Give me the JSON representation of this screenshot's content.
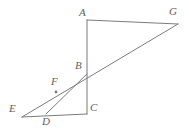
{
  "figure": {
    "stroke_color": "#7b7b7b",
    "label_color": "#5f5f5f",
    "background_color": "#ffffff",
    "stroke_width": 1,
    "points": [
      {
        "name": "A",
        "label": "A",
        "x": 87,
        "y": 20,
        "label_x": 79,
        "label_y": 7
      },
      {
        "name": "B",
        "label": "B",
        "x": 87,
        "y": 74,
        "label_x": 75,
        "label_y": 60
      },
      {
        "name": "C",
        "label": "C",
        "x": 87,
        "y": 114,
        "label_x": 90,
        "label_y": 102
      },
      {
        "name": "D",
        "label": "D",
        "x": 46,
        "y": 114,
        "label_x": 42,
        "label_y": 116
      },
      {
        "name": "E",
        "label": "E",
        "x": 22,
        "y": 117,
        "label_x": 9,
        "label_y": 103
      },
      {
        "name": "F",
        "label": "F",
        "x": 56,
        "y": 92,
        "label_x": 51,
        "label_y": 76
      },
      {
        "name": "G",
        "label": "G",
        "x": 178,
        "y": 24,
        "label_x": 169,
        "label_y": 6
      }
    ],
    "segments": [
      {
        "name": "segment-A-G",
        "from": "A",
        "to": "G"
      },
      {
        "name": "segment-A-C",
        "from": "A",
        "to": "C"
      },
      {
        "name": "segment-E-C",
        "from": "E",
        "to": "C"
      },
      {
        "name": "segment-E-G",
        "from": "E",
        "to": "G"
      },
      {
        "name": "segment-D-B",
        "from": "D",
        "to": "B"
      }
    ],
    "marked_points": [
      {
        "name": "point-F",
        "x": 56,
        "y": 92,
        "r": 1.4
      }
    ]
  }
}
